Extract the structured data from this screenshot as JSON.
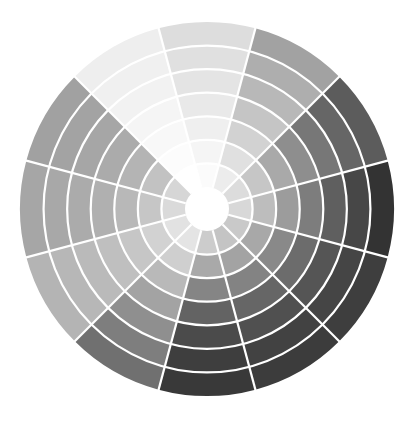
{
  "diagram": {
    "title": "Grayscale color wheel",
    "center": {
      "x": 207,
      "y": 209
    },
    "inner_radius": 22,
    "outer_radius": 187,
    "ring_count": 7,
    "segment_count": 12,
    "start_angle_deg": -15,
    "divider_color": "#ffffff",
    "divider_width": 2.2,
    "center_color": "#ffffff",
    "segments": [
      {
        "name": "segment-0deg",
        "angle": 0,
        "rings": [
          "#d8d8d8",
          "#bdbdbd",
          "#9c9c9c",
          "#7d7d7d",
          "#5f5f5f",
          "#474747",
          "#333333"
        ]
      },
      {
        "name": "segment-30deg",
        "angle": 30,
        "rings": [
          "#dcdcdc",
          "#c6c6c6",
          "#a9a9a9",
          "#8e8e8e",
          "#777777",
          "#666666",
          "#5c5c5c"
        ]
      },
      {
        "name": "segment-60deg",
        "angle": 60,
        "rings": [
          "#ececec",
          "#e0e0e0",
          "#d2d2d2",
          "#c5c5c5",
          "#b8b8b8",
          "#aeaeae",
          "#a2a2a2"
        ]
      },
      {
        "name": "segment-90deg",
        "angle": 90,
        "rings": [
          "#fbfbfb",
          "#f5f5f5",
          "#efefef",
          "#e9e9e9",
          "#e4e4e4",
          "#e0e0e0",
          "#dddddd"
        ]
      },
      {
        "name": "segment-120deg",
        "angle": 120,
        "rings": [
          "#ffffff",
          "#fcfcfc",
          "#f8f8f8",
          "#f5f5f5",
          "#f2f2f2",
          "#f0f0f0",
          "#eeeeee"
        ]
      },
      {
        "name": "segment-150deg",
        "angle": 150,
        "rings": [
          "#d6d6d6",
          "#c2c2c2",
          "#b4b4b4",
          "#ababab",
          "#a6a6a6",
          "#a3a3a3",
          "#a1a1a1"
        ]
      },
      {
        "name": "segment-180deg",
        "angle": 180,
        "rings": [
          "#dadada",
          "#c6c6c6",
          "#b8b8b8",
          "#b0b0b0",
          "#ababab",
          "#a8a8a8",
          "#a6a6a6"
        ]
      },
      {
        "name": "segment-210deg",
        "angle": 210,
        "rings": [
          "#e2e2e2",
          "#d2d2d2",
          "#c6c6c6",
          "#bfbfbf",
          "#bababa",
          "#b7b7b7",
          "#b4b4b4"
        ]
      },
      {
        "name": "segment-240deg",
        "angle": 240,
        "rings": [
          "#e4e4e4",
          "#cfcfcf",
          "#b9b9b9",
          "#a3a3a3",
          "#8f8f8f",
          "#7e7e7e",
          "#707070"
        ]
      },
      {
        "name": "segment-270deg",
        "angle": 270,
        "rings": [
          "#cccccc",
          "#a9a9a9",
          "#858585",
          "#636363",
          "#4b4b4b",
          "#3e3e3e",
          "#393939"
        ]
      },
      {
        "name": "segment-300deg",
        "angle": 300,
        "rings": [
          "#c4c4c4",
          "#a3a3a3",
          "#838383",
          "#666666",
          "#505050",
          "#424242",
          "#3c3c3c"
        ]
      },
      {
        "name": "segment-330deg",
        "angle": 330,
        "rings": [
          "#c9c9c9",
          "#a8a8a8",
          "#898989",
          "#6c6c6c",
          "#555555",
          "#454545",
          "#3e3e3e"
        ]
      }
    ]
  }
}
